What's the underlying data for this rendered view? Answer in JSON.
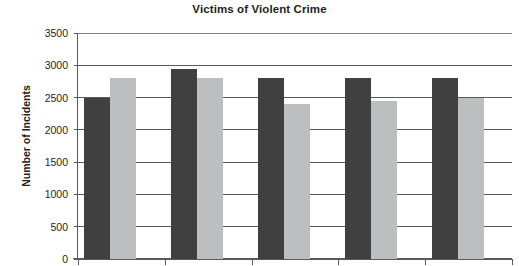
{
  "chart_data": {
    "type": "bar",
    "title": "Victims of Violent Crime",
    "xlabel": "",
    "ylabel": "Number of Incidents",
    "ylim": [
      0,
      3500
    ],
    "ytick_step": 500,
    "yticks": [
      "0",
      "500",
      "1000",
      "1500",
      "2000",
      "2500",
      "3000",
      "3500"
    ],
    "grid": true,
    "legend": "none",
    "categories": [
      "1",
      "2",
      "3",
      "4",
      "5"
    ],
    "xtick_labels": [
      "",
      "",
      "",
      "",
      ""
    ],
    "series": [
      {
        "name": "Series 1",
        "color": "#404041",
        "values": [
          2500,
          2950,
          2800,
          2800,
          2800
        ]
      },
      {
        "name": "Series 2",
        "color": "#bcbec0",
        "values": [
          2800,
          2800,
          2400,
          2450,
          2500
        ]
      }
    ]
  },
  "colors": {
    "axis": "#58595b",
    "grid": "#58595b",
    "text": "#231f20",
    "background": "#ffffff",
    "series_dark": "#404041",
    "series_light": "#bcbec0"
  }
}
